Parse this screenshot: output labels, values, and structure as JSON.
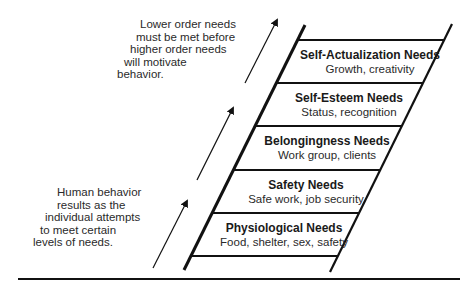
{
  "annotations": {
    "top": {
      "lines": [
        "Lower order needs",
        "must be met before",
        "higher order needs",
        "will motivate",
        "behavior."
      ]
    },
    "bottom": {
      "lines": [
        "Human behavior",
        "results as the",
        "individual attempts",
        "to meet certain",
        "levels of needs."
      ]
    }
  },
  "levels": [
    {
      "title": "Self-Actualization Needs",
      "description": "Growth, creativity"
    },
    {
      "title": "Self-Esteem Needs",
      "description": "Status, recognition"
    },
    {
      "title": "Belongingness Needs",
      "description": "Work group, clients"
    },
    {
      "title": "Safety Needs",
      "description": "Safe work, job security"
    },
    {
      "title": "Physiological Needs",
      "description": "Food, shelter, sex, safety"
    }
  ],
  "colors": {
    "line": "#111111",
    "background": "#ffffff"
  }
}
